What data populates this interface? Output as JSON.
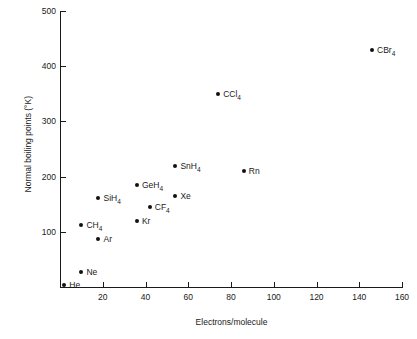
{
  "chart_data": {
    "type": "scatter",
    "title": "",
    "xlabel": "Electrons/molecule",
    "ylabel": "Normal boiling points (°K)",
    "xlim": [
      0,
      160
    ],
    "ylim": [
      0,
      500
    ],
    "grid": false,
    "legend": "none",
    "xticks": [
      "20",
      "40",
      "60",
      "80",
      "100",
      "120",
      "140",
      "160"
    ],
    "xtick_values": [
      20,
      40,
      60,
      80,
      100,
      120,
      140,
      160
    ],
    "yticks": [
      "100",
      "200",
      "300",
      "400",
      "500"
    ],
    "ytick_values": [
      100,
      200,
      300,
      400,
      500
    ],
    "points": [
      {
        "label": "He",
        "sub": "",
        "x": 2,
        "y": 4,
        "label_side": "right"
      },
      {
        "label": "Ne",
        "sub": "",
        "x": 10,
        "y": 27,
        "label_side": "right"
      },
      {
        "label": "Ar",
        "sub": "",
        "x": 18,
        "y": 87,
        "label_side": "right"
      },
      {
        "label": "CH",
        "sub": "4",
        "x": 10,
        "y": 112,
        "label_side": "right"
      },
      {
        "label": "Kr",
        "sub": "",
        "x": 36,
        "y": 120,
        "label_side": "right"
      },
      {
        "label": "CF",
        "sub": "4",
        "x": 42,
        "y": 145,
        "label_side": "right"
      },
      {
        "label": "SiH",
        "sub": "4",
        "x": 18,
        "y": 161,
        "label_side": "right"
      },
      {
        "label": "Xe",
        "sub": "",
        "x": 54,
        "y": 165,
        "label_side": "right"
      },
      {
        "label": "GeH",
        "sub": "4",
        "x": 36,
        "y": 185,
        "label_side": "right"
      },
      {
        "label": "Rn",
        "sub": "",
        "x": 86,
        "y": 211,
        "label_side": "right"
      },
      {
        "label": "SnH",
        "sub": "4",
        "x": 54,
        "y": 220,
        "label_side": "right"
      },
      {
        "label": "CCl",
        "sub": "4",
        "x": 74,
        "y": 350,
        "label_side": "right"
      },
      {
        "label": "CBr",
        "sub": "4",
        "x": 146,
        "y": 430,
        "label_side": "right"
      }
    ]
  },
  "colors": {
    "axis": "#1a1a1a",
    "point": "#111111",
    "background": "#ffffff"
  }
}
